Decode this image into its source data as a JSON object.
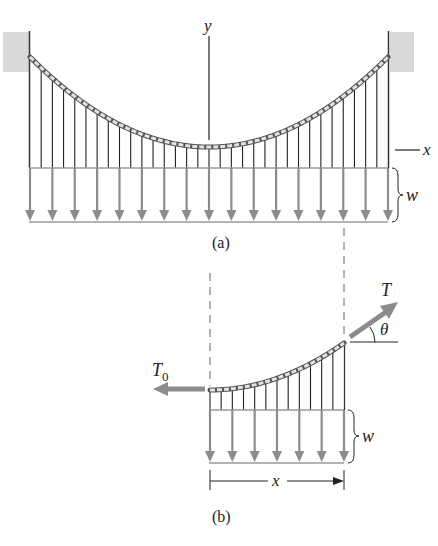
{
  "figure_a": {
    "caption": "(a)",
    "y_axis_label": "y",
    "x_axis_label": "x",
    "load_label": "w",
    "arrow_count": 17,
    "span": {
      "left_x": 30,
      "right_x": 388
    },
    "cable": {
      "left_y": 57,
      "right_y": 57,
      "sag_y": 147
    },
    "load_top_y": 168,
    "load_bottom_y": 222
  },
  "figure_b": {
    "caption": "(b)",
    "tension_label": "T",
    "horizontal_tension_label": "T",
    "horizontal_tension_subscript": "0",
    "angle_label": "θ",
    "load_label": "w",
    "span_label": "x",
    "arrow_count": 7,
    "span": {
      "left_x": 210,
      "right_x": 344
    },
    "cable": {
      "left_y": 390,
      "right_y": 343
    }
  },
  "colors": {
    "arrow_gray": "#8c8c8c",
    "line_dark": "#222222",
    "cable_fill": "#d8d8d8",
    "anchor_fill": "#d6d6d6",
    "dash": "#666666"
  }
}
